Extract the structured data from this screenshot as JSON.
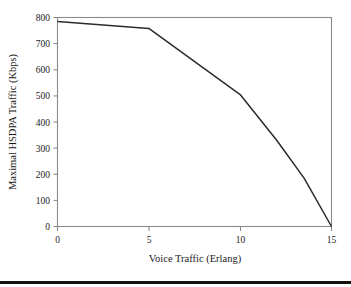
{
  "chart_data": {
    "type": "line",
    "title": "",
    "xlabel": "Voice Traffic (Erlang)",
    "ylabel": "Maximal HSDPA Traffic (Kbps)",
    "xlim": [
      0,
      15
    ],
    "ylim": [
      0,
      800
    ],
    "xticks": [
      0,
      5,
      10,
      15
    ],
    "yticks": [
      0,
      100,
      200,
      300,
      400,
      500,
      600,
      700,
      800
    ],
    "xtick_labels": [
      "0",
      "5",
      "10",
      "15"
    ],
    "ytick_labels": [
      "0",
      "100",
      "200",
      "300",
      "400",
      "500",
      "600",
      "700",
      "800"
    ],
    "grid": false,
    "legend": false,
    "frame": "box",
    "series": [
      {
        "name": "Maximal HSDPA Traffic",
        "color": "#2b2b2b",
        "x": [
          0,
          5,
          10,
          12,
          13.5,
          15
        ],
        "values": [
          785,
          758,
          505,
          330,
          185,
          0
        ]
      }
    ]
  },
  "axis_labels": {
    "x_title": "Voice Traffic (Erlang)",
    "y_title": "Maximal HSDPA Traffic (Kbps)"
  },
  "colors": {
    "line": "#2b2b2b",
    "axis": "#8a8a8a",
    "text": "#1a1a1a",
    "rule": "#111111",
    "background": "#ffffff"
  }
}
